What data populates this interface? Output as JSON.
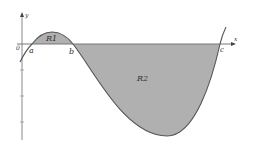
{
  "diagram": {
    "type": "function-graph-with-shaded-regions",
    "axes": {
      "x_label": "x",
      "y_label": "y",
      "origin_label": "0"
    },
    "points": [
      {
        "label": "a",
        "role": "x-intercept"
      },
      {
        "label": "b",
        "role": "x-intercept"
      },
      {
        "label": "c",
        "role": "x-intercept"
      }
    ],
    "regions": [
      {
        "label": "R1",
        "between": [
          "a",
          "b"
        ],
        "position": "above x-axis"
      },
      {
        "label": "R2",
        "between": [
          "b",
          "c"
        ],
        "position": "below x-axis"
      }
    ],
    "colors": {
      "fill": "#b0b0b0",
      "curve": "#555555",
      "axis": "#777777"
    }
  }
}
